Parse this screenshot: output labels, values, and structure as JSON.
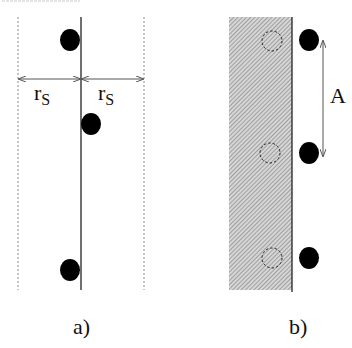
{
  "diagram": {
    "panel_a": {
      "caption": "a)",
      "left_label": "r",
      "left_label_sub": "S",
      "right_label": "r",
      "right_label_sub": "S",
      "dots": [
        {
          "cx": 70,
          "cy": 40
        },
        {
          "cx": 91,
          "cy": 124
        },
        {
          "cx": 70,
          "cy": 270
        }
      ]
    },
    "panel_b": {
      "caption": "b)",
      "amplitude_label": "A",
      "dashed_circles": [
        {
          "cx": 272,
          "cy": 41
        },
        {
          "cx": 270,
          "cy": 153
        },
        {
          "cx": 272,
          "cy": 258
        }
      ],
      "dots": [
        {
          "cx": 309,
          "cy": 40
        },
        {
          "cx": 309,
          "cy": 153
        },
        {
          "cx": 309,
          "cy": 258
        }
      ]
    },
    "colors": {
      "ink": "#111111",
      "dashed": "#888888",
      "hatch_bg": "#d8d8d8",
      "hatch_line": "#7a7a7a"
    }
  }
}
